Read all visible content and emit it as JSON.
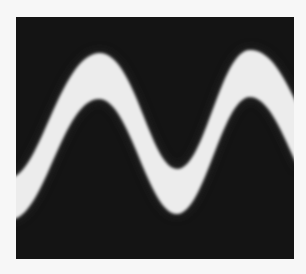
{
  "image": {
    "description": "Oscilloscope-style photo of a thick bright sine-wave trace on a dark screen",
    "colors": {
      "background": "#f7f7f7",
      "screen": "#141414",
      "trace": "#ececec"
    },
    "trace": {
      "shape": "sine band",
      "visible_peaks": 2,
      "visible_valleys": 1
    }
  }
}
